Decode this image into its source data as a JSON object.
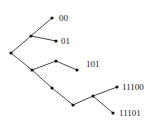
{
  "diagram": {
    "type": "binary-code-tree",
    "nodes": [
      {
        "id": "root",
        "x": 11,
        "y": 53
      },
      {
        "id": "n0",
        "x": 31,
        "y": 36
      },
      {
        "id": "leaf00",
        "x": 52,
        "y": 18,
        "label": "00"
      },
      {
        "id": "leaf01",
        "x": 56,
        "y": 41,
        "label": "01"
      },
      {
        "id": "n1",
        "x": 32,
        "y": 70
      },
      {
        "id": "n10",
        "x": 56,
        "y": 61
      },
      {
        "id": "leaf101",
        "x": 77,
        "y": 70,
        "label": "101"
      },
      {
        "id": "n11",
        "x": 52,
        "y": 88
      },
      {
        "id": "n111",
        "x": 73,
        "y": 105
      },
      {
        "id": "n1110",
        "x": 93,
        "y": 96
      },
      {
        "id": "leaf11100",
        "x": 117,
        "y": 87,
        "label": "11100"
      },
      {
        "id": "leaf11101",
        "x": 113,
        "y": 113,
        "label": "11101"
      }
    ],
    "edges": [
      [
        "root",
        "n0"
      ],
      [
        "n0",
        "leaf00"
      ],
      [
        "n0",
        "leaf01"
      ],
      [
        "root",
        "n1"
      ],
      [
        "n1",
        "n10"
      ],
      [
        "n10",
        "leaf101"
      ],
      [
        "n1",
        "n11"
      ],
      [
        "n11",
        "n111"
      ],
      [
        "n111",
        "n1110"
      ],
      [
        "n1110",
        "leaf11100"
      ],
      [
        "n1110",
        "leaf11101"
      ]
    ],
    "labels": {
      "leaf00": "00",
      "leaf01": "01",
      "leaf101": "101",
      "leaf11100": "11100",
      "leaf11101": "11101"
    }
  }
}
